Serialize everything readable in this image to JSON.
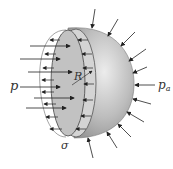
{
  "diagram": {
    "labels": {
      "inner_pressure": "p",
      "outer_pressure": "p",
      "outer_pressure_sub": "a",
      "radius": "R",
      "stress": "σ"
    },
    "colors": {
      "shell_light": "#e6e6e6",
      "shell_dark": "#8f8f8f",
      "cut_face": "#c4c4c4",
      "ring": "#d6d6d6",
      "arrow": "#222222",
      "background": "#ffffff"
    }
  }
}
